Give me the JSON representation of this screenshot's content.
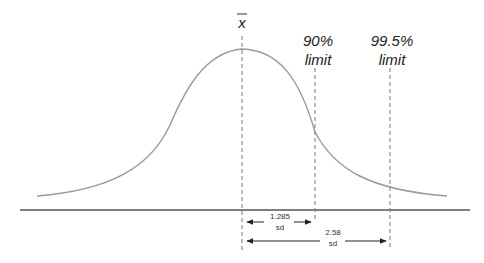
{
  "diagram": {
    "mean_label": "x̄",
    "mean_symbol": "x",
    "limits": [
      {
        "line1": "90%",
        "line2": "limit",
        "sd": "1.285",
        "sd_unit": "sd"
      },
      {
        "line1": "99.5%",
        "line2": "limit",
        "sd": "2.58",
        "sd_unit": "sd"
      }
    ],
    "colors": {
      "curve": "#9a9a9a",
      "axis": "#555555",
      "dash": "#777777",
      "arrow": "#222222"
    }
  }
}
